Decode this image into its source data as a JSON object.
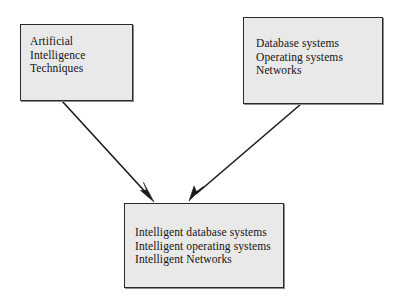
{
  "diagram": {
    "background_color": "#ffffff",
    "node_fill_color": "#e9e9e9",
    "node_border_color": "#2b2b2b",
    "text_color": "#141414",
    "arrow_color": "#1a1a1a",
    "nodes": [
      {
        "id": "ai",
        "name": "artificial-intelligence-techniques",
        "lines": [
          "Artificial",
          "Intelligence",
          "Techniques"
        ],
        "text": "Artificial\nIntelligence\nTechniques"
      },
      {
        "id": "systems",
        "name": "conventional-systems",
        "lines": [
          "Database systems",
          "Operating systems",
          "Networks"
        ],
        "text": "Database systems\nOperating systems\nNetworks"
      },
      {
        "id": "intelligent",
        "name": "intelligent-systems",
        "lines": [
          "Intelligent database systems",
          "Intelligent operating systems",
          "Intelligent Networks"
        ],
        "text": "Intelligent database systems\nIntelligent operating systems\nIntelligent Networks"
      }
    ],
    "edges": [
      {
        "id": "ai-to-intelligent",
        "from": "ai",
        "to": "intelligent",
        "marker": "arrowhead"
      },
      {
        "id": "systems-to-intelligent",
        "from": "systems",
        "to": "intelligent",
        "marker": "arrowhead"
      }
    ]
  }
}
